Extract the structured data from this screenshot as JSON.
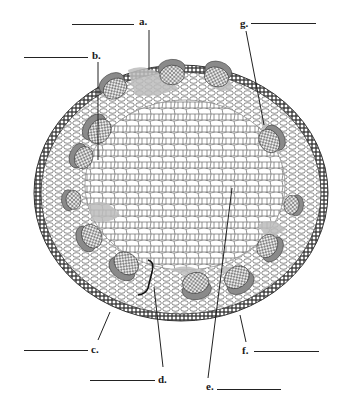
{
  "diagram": {
    "colors": {
      "epidermis": "#3a3a3a",
      "cortex_cell_stroke": "#555555",
      "pith_cell_stroke": "#666666",
      "phloem_fill": "#8a8a8a",
      "xylem_fill": "#ffffff",
      "cambium_fill": "#bdbdbd",
      "background": "#ffffff"
    },
    "labels": [
      {
        "id": "a",
        "text": "a.",
        "x": 139,
        "y": 16,
        "blank": {
          "x1": 72,
          "x2": 134,
          "y": 24
        },
        "pointer": {
          "x1": 149,
          "y1": 30,
          "x2": 149,
          "y2": 70
        }
      },
      {
        "id": "b",
        "text": "b.",
        "x": 92,
        "y": 50,
        "blank": {
          "x1": 24,
          "x2": 88,
          "y": 57
        },
        "pointer": {
          "x1": 98,
          "y1": 62,
          "x2": 98,
          "y2": 160
        }
      },
      {
        "id": "g",
        "text": "g.",
        "x": 240,
        "y": 18,
        "blank": {
          "x1": 251,
          "x2": 316,
          "y": 23
        },
        "pointer": {
          "x1": 246,
          "y1": 31,
          "x2": 264,
          "y2": 125
        }
      },
      {
        "id": "c",
        "text": "c.",
        "x": 91,
        "y": 344,
        "blank": {
          "x1": 24,
          "x2": 88,
          "y": 350
        },
        "pointer": {
          "x1": 98,
          "y1": 340,
          "x2": 110,
          "y2": 312
        }
      },
      {
        "id": "d",
        "text": "d.",
        "x": 158,
        "y": 374,
        "blank": {
          "x1": 90,
          "x2": 155,
          "y": 380
        },
        "pointer": {
          "x1": 163,
          "y1": 367,
          "x2": 154,
          "y2": 287
        }
      },
      {
        "id": "e",
        "text": "e.",
        "x": 206,
        "y": 381,
        "blank": {
          "x1": 217,
          "x2": 281,
          "y": 389
        },
        "pointer": {
          "x1": 208,
          "y1": 378,
          "x2": 232,
          "y2": 188
        }
      },
      {
        "id": "f",
        "text": "f.",
        "x": 242,
        "y": 345,
        "blank": {
          "x1": 254,
          "x2": 319,
          "y": 351
        },
        "pointer": {
          "x1": 246,
          "y1": 342,
          "x2": 240,
          "y2": 315
        }
      }
    ],
    "vascular_bundles": [
      {
        "cx": 114,
        "cy": 87,
        "r": 13
      },
      {
        "cx": 172,
        "cy": 73,
        "r": 13
      },
      {
        "cx": 217,
        "cy": 75,
        "r": 13
      },
      {
        "cx": 98,
        "cy": 130,
        "r": 14
      },
      {
        "cx": 82,
        "cy": 157,
        "r": 12
      },
      {
        "cx": 72,
        "cy": 200,
        "r": 10
      },
      {
        "cx": 90,
        "cy": 237,
        "r": 13
      },
      {
        "cx": 125,
        "cy": 265,
        "r": 14
      },
      {
        "cx": 196,
        "cy": 285,
        "r": 14
      },
      {
        "cx": 238,
        "cy": 279,
        "r": 14
      },
      {
        "cx": 269,
        "cy": 247,
        "r": 13
      },
      {
        "cx": 293,
        "cy": 205,
        "r": 10
      },
      {
        "cx": 271,
        "cy": 140,
        "r": 13
      }
    ]
  }
}
